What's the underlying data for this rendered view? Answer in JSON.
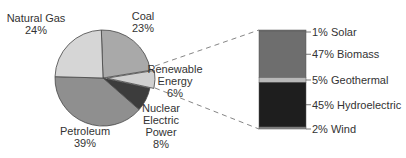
{
  "chart_data": {
    "type": "pie",
    "title": "",
    "slices": [
      {
        "name": "Coal",
        "label_lines": [
          "Coal",
          "23%"
        ],
        "value": 23,
        "color": "#a9a9a9"
      },
      {
        "name": "Renewable Energy",
        "label_lines": [
          "Renewable",
          "Energy",
          "6%"
        ],
        "value": 6,
        "color": "#d0d0d0",
        "exploded": true
      },
      {
        "name": "Nuclear Electric Power",
        "label_lines": [
          "Nuclear",
          "Electric",
          "Power",
          "8%"
        ],
        "value": 8,
        "color": "#3c3c3c"
      },
      {
        "name": "Petroleum",
        "label_lines": [
          "Petroleum",
          "39%"
        ],
        "value": 39,
        "color": "#8f8f8f"
      },
      {
        "name": "Natural Gas",
        "label_lines": [
          "Natural Gas",
          "24%"
        ],
        "value": 24,
        "color": "#d6d6d6"
      }
    ],
    "breakdown": {
      "parent": "Renewable Energy",
      "type": "stacked-bar",
      "segments": [
        {
          "name": "Solar",
          "label": "1% Solar",
          "value": 1,
          "color": "#8a8a8a"
        },
        {
          "name": "Biomass",
          "label": "47% Biomass",
          "value": 47,
          "color": "#6e6e6e"
        },
        {
          "name": "Geothermal",
          "label": "5% Geothermal",
          "value": 5,
          "color": "#b8b8b8"
        },
        {
          "name": "Hydroelectric",
          "label": "45% Hydroelectric",
          "value": 45,
          "color": "#1e1e1e"
        },
        {
          "name": "Wind",
          "label": "2% Wind",
          "value": 2,
          "color": "#8a8a8a"
        }
      ]
    }
  }
}
